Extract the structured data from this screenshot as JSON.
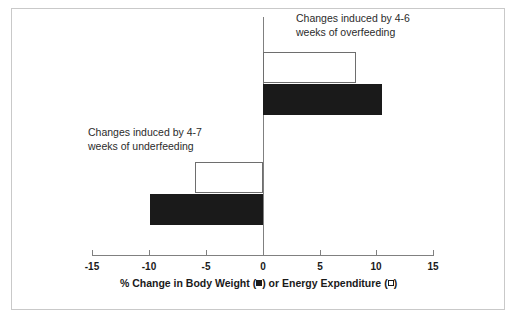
{
  "chart_data": {
    "type": "bar",
    "orientation": "horizontal",
    "title": "",
    "xlabel_parts": {
      "prefix": "% Change in Body Weight (",
      "middle": ") or Energy Expenditure (",
      "suffix": ")"
    },
    "xlabel": "% Change in Body Weight (■) or Energy Expenditure (□)",
    "ylabel": "",
    "xlim": [
      -15,
      15
    ],
    "xticks": [
      -15,
      -10,
      -5,
      0,
      5,
      10,
      15
    ],
    "xticklabels": [
      "-15",
      "-10",
      "-5",
      "0",
      "5",
      "10",
      "15"
    ],
    "grid": false,
    "legend": "inline-in-axis-label",
    "series": [
      {
        "name": "Energy Expenditure",
        "marker": "open-square",
        "style": "open",
        "values": [
          8.2,
          -6.0
        ]
      },
      {
        "name": "Body Weight",
        "marker": "filled-square",
        "style": "filled",
        "values": [
          10.5,
          -10.0
        ]
      }
    ],
    "categories": [
      "Overfeeding (4-6 weeks)",
      "Underfeeding (4-7 weeks)"
    ],
    "bars": [
      {
        "id": "overfeeding-energy-expenditure",
        "group": "overfeeding",
        "series": "Energy Expenditure",
        "style": "open",
        "value": 8.2
      },
      {
        "id": "overfeeding-body-weight",
        "group": "overfeeding",
        "series": "Body Weight",
        "style": "filled",
        "value": 10.5
      },
      {
        "id": "underfeeding-energy-expenditure",
        "group": "underfeeding",
        "series": "Energy Expenditure",
        "style": "open",
        "value": -6.0
      },
      {
        "id": "underfeeding-body-weight",
        "group": "underfeeding",
        "series": "Body Weight",
        "style": "filled",
        "value": -10.0
      }
    ],
    "annotations": [
      {
        "id": "overfeeding-annotation",
        "text": "Changes induced by 4-6\nweeks of overfeeding"
      },
      {
        "id": "underfeeding-annotation",
        "text": "Changes induced by 4-7\nweeks of underfeeding"
      }
    ]
  },
  "colors": {
    "bar_filled": "#1a1a1a",
    "bar_open_fill": "#ffffff",
    "bar_open_stroke": "#6e6e6e",
    "axis": "#808080",
    "text": "#1a1a1a",
    "annotation_text": "#2b2b2b",
    "frame": "#c9c9c9",
    "background": "#ffffff"
  }
}
